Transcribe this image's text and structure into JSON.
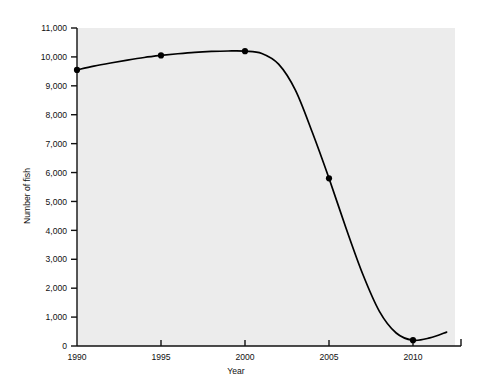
{
  "chart_data": {
    "type": "line",
    "title": "",
    "xlabel": "Year",
    "ylabel": "Number of fish",
    "xlim": [
      1990,
      2012.5
    ],
    "ylim": [
      0,
      11000
    ],
    "grid": false,
    "legend": "none",
    "plot_background": "#ececec",
    "line_color": "#000000",
    "marker_color": "#000000",
    "x_ticks": [
      1990,
      1995,
      2000,
      2005,
      2010
    ],
    "x_tick_labels": [
      "1990",
      "1995",
      "2000",
      "2005",
      "2010"
    ],
    "y_ticks": [
      0,
      1000,
      2000,
      3000,
      4000,
      5000,
      6000,
      7000,
      8000,
      9000,
      10000,
      11000
    ],
    "y_tick_labels": [
      "0",
      "1,000",
      "2,000",
      "3,000",
      "4,000",
      "5,000",
      "6,000",
      "7,000",
      "8,000",
      "9,000",
      "10,000",
      "11,000"
    ],
    "markers": [
      {
        "x": 1990,
        "y": 9550
      },
      {
        "x": 1995,
        "y": 10050
      },
      {
        "x": 2000,
        "y": 10200
      },
      {
        "x": 2005,
        "y": 5800
      },
      {
        "x": 2010,
        "y": 200
      }
    ],
    "series": [
      {
        "name": "Number of fish",
        "x": [
          1990,
          1991,
          1992,
          1993,
          1994,
          1995,
          1996,
          1997,
          1998,
          1999,
          2000,
          2001,
          2002,
          2003,
          2004,
          2005,
          2006,
          2007,
          2008,
          2009,
          2010,
          2011,
          2012
        ],
        "values": [
          9550,
          9680,
          9790,
          9890,
          9980,
          10050,
          10110,
          10160,
          10190,
          10205,
          10200,
          10120,
          9750,
          8850,
          7400,
          5800,
          4100,
          2500,
          1200,
          450,
          200,
          280,
          480
        ]
      }
    ]
  }
}
